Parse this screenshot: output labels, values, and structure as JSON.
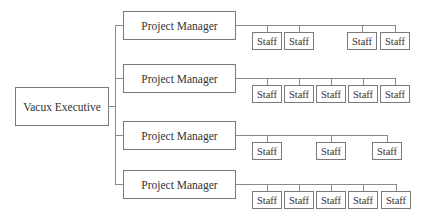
{
  "diagram": {
    "type": "org-chart",
    "root": {
      "label": "Vacux Executive"
    },
    "managers": [
      {
        "label": "Project Manager",
        "staff": [
          "Staff",
          "Staff",
          "Staff",
          "Staff"
        ]
      },
      {
        "label": "Project Manager",
        "staff": [
          "Staff",
          "Staff",
          "Staff",
          "Staff",
          "Staff"
        ]
      },
      {
        "label": "Project Manager",
        "staff": [
          "Staff",
          "Staff",
          "Staff"
        ]
      },
      {
        "label": "Project Manager",
        "staff": [
          "Staff",
          "Staff",
          "Staff",
          "Staff",
          "Staff"
        ]
      }
    ]
  }
}
